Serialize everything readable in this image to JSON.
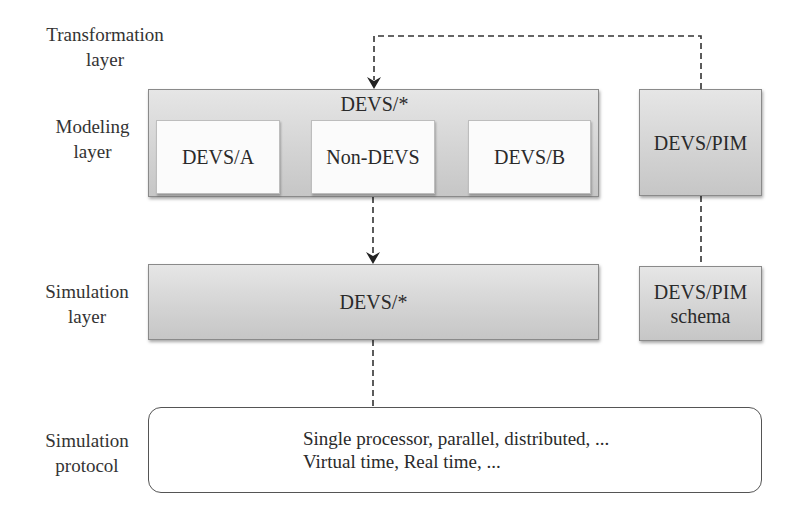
{
  "layers": {
    "transformation": {
      "line1": "Transformation",
      "line2": "layer"
    },
    "modeling": {
      "line1": "Modeling",
      "line2": "layer"
    },
    "simulation": {
      "line1": "Simulation",
      "line2": "layer"
    },
    "protocol": {
      "line1": "Simulation",
      "line2": "protocol"
    }
  },
  "modeling_box": {
    "title": "DEVS/*",
    "children": [
      {
        "label": "DEVS/A"
      },
      {
        "label": "Non-DEVS"
      },
      {
        "label": "DEVS/B"
      }
    ]
  },
  "pim_box": {
    "label": "DEVS/PIM"
  },
  "simulation_box": {
    "label": "DEVS/*"
  },
  "pim_schema_box": {
    "line1": "DEVS/PIM",
    "line2": "schema"
  },
  "protocol_box": {
    "line1": "Single processor, parallel, distributed, ...",
    "line2": "Virtual time, Real time, ..."
  },
  "connectors": [
    {
      "from": "DEVS/PIM",
      "to": "DEVS/*",
      "style": "dashed",
      "arrow": true
    },
    {
      "from": "Non-DEVS",
      "to": "DEVS/* (simulation)",
      "style": "dashed",
      "arrow": true
    },
    {
      "from": "DEVS/PIM",
      "to": "DEVS/PIM schema",
      "style": "dashed",
      "arrow": false
    },
    {
      "from": "DEVS/* (simulation)",
      "to": "Simulation protocol",
      "style": "dashed",
      "arrow": false
    }
  ]
}
